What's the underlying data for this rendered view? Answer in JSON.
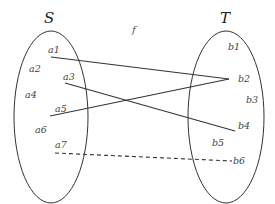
{
  "diagram": {
    "function_label": "f",
    "sets": [
      {
        "name": "S",
        "elements": [
          "a1",
          "a2",
          "a3",
          "a4",
          "a5",
          "a6",
          "a7"
        ]
      },
      {
        "name": "T",
        "elements": [
          "b1",
          "b2",
          "b3",
          "b4",
          "b5",
          "b6"
        ]
      }
    ],
    "mappings": [
      {
        "from": "a1",
        "to": "b2",
        "style": "solid"
      },
      {
        "from": "a3",
        "to": "b4",
        "style": "solid"
      },
      {
        "from": "a5",
        "to": "b2",
        "style": "solid"
      },
      {
        "from": "a7",
        "to": "b6",
        "style": "dashed"
      }
    ],
    "colors": {
      "stroke": "#333333",
      "text": "#444444",
      "background": "#ffffff"
    }
  }
}
